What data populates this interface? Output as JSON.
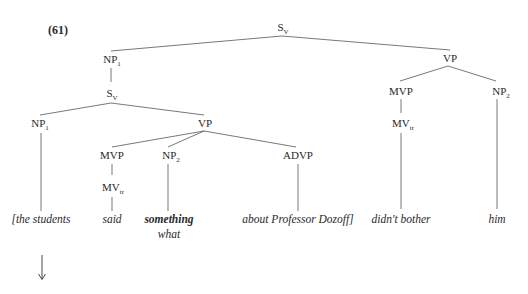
{
  "example_number": "(61)",
  "nodes": {
    "root": {
      "base": "S",
      "sub": "V"
    },
    "np1_top": {
      "base": "NP",
      "sub": "1"
    },
    "sv_inner": {
      "base": "S",
      "sub": "V"
    },
    "np1_inner": {
      "base": "NP",
      "sub": "1"
    },
    "vp_inner": {
      "base": "VP",
      "sub": ""
    },
    "mvp_inner": {
      "base": "MVP",
      "sub": ""
    },
    "mvtr_inner": {
      "base": "MV",
      "sub": "tr"
    },
    "np2_inner": {
      "base": "NP",
      "sub": "2"
    },
    "advp": {
      "base": "ADVP",
      "sub": ""
    },
    "vp_main": {
      "base": "VP",
      "sub": ""
    },
    "mvp_main": {
      "base": "MVP",
      "sub": ""
    },
    "mvtr_main": {
      "base": "MV",
      "sub": "tr"
    },
    "np2_main": {
      "base": "NP",
      "sub": "2"
    }
  },
  "words": {
    "the_students": "[the students",
    "said": "said",
    "something": "something",
    "what": "what",
    "about": "about Professor Dozoff]",
    "didnt_bother": "didn't bother",
    "him": "him"
  },
  "arrow": "↓",
  "colors": {
    "line": "#555555",
    "text": "#2a2a2a"
  }
}
